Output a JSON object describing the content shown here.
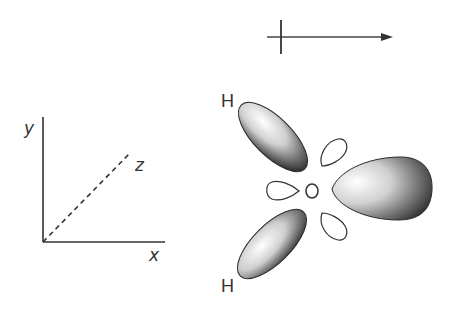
{
  "diagram": {
    "colors": {
      "ink": "#333333",
      "lobe_dark": "#2a2a2a",
      "lobe_light": "#f4f4f4",
      "background": "#ffffff"
    },
    "dipole_arrow": {
      "symbol": "crossed-arrow",
      "direction": "right"
    },
    "axes": {
      "x_label": "x",
      "y_label": "y",
      "z_label": "z",
      "z_style": "dashed"
    },
    "atoms": {
      "hydrogen_top": "H",
      "hydrogen_bottom": "H",
      "oxygen": "O"
    },
    "lobes": {
      "shaded": [
        "upper-left (H)",
        "lower-left (H)",
        "right"
      ],
      "outline": [
        "upper-small",
        "left-small",
        "lower-small"
      ]
    }
  }
}
